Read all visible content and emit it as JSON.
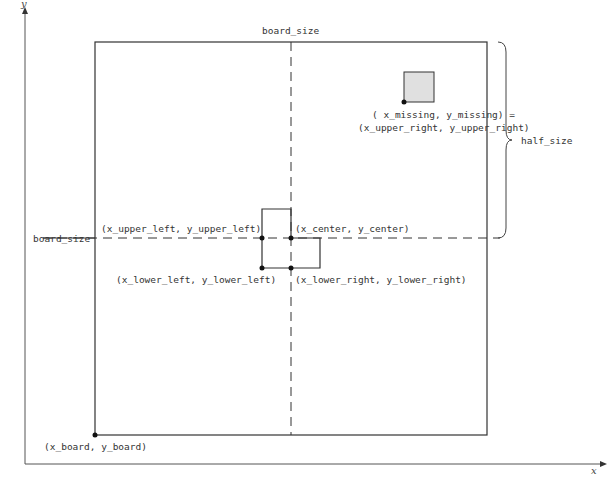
{
  "diagram": {
    "type": "tromino-tiling-board",
    "axes": {
      "x_label": "x",
      "y_label": "y"
    },
    "labels": {
      "top_board_size": "board_size",
      "left_board_size": "board_size",
      "half_size": "half_size",
      "missing_line1": "( x_missing, y_missing) =",
      "missing_line2": "(x_upper_right, y_upper_right)",
      "upper_left": "(x_upper_left, y_upper_left)",
      "center": "(x_center, y_center)",
      "lower_left": "(x_lower_left, y_lower_left)",
      "lower_right": "(x_lower_right, y_lower_right)",
      "board_origin": "(x_board, y_board)"
    },
    "colors": {
      "line": "#333333",
      "missing_fill": "#e0e0e0",
      "background": "#ffffff"
    }
  }
}
